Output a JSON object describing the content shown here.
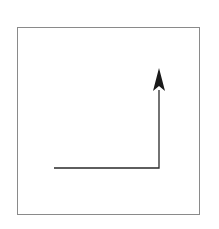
{
  "diagram": {
    "type": "arrow-path",
    "frame": {
      "x": 17,
      "y": 27,
      "width": 183,
      "height": 188,
      "stroke": "#8a8a8a"
    },
    "path": {
      "description": "Horizontal line moving right, then turning up, ending in an upward arrowhead",
      "points": [
        [
          54,
          168
        ],
        [
          159,
          168
        ],
        [
          159,
          90
        ]
      ],
      "stroke": "#2a2a2a",
      "arrowhead": {
        "direction": "up",
        "tip": [
          159,
          68
        ],
        "color": "#1a1a1a"
      }
    },
    "caption": ""
  }
}
